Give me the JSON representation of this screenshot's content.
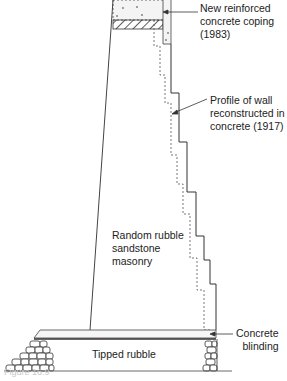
{
  "diagram": {
    "type": "wall cross-section",
    "labels": {
      "coping": [
        "New reinforced",
        "concrete coping",
        "(1983)"
      ],
      "profile": [
        "Profile of wall",
        "reconstructed in",
        "concrete (1917)"
      ],
      "masonry": [
        "Random rubble",
        "sandstone",
        "masonry"
      ],
      "blinding": [
        "Concrete",
        "blinding"
      ],
      "rubble": "Tipped rubble"
    },
    "caption": "Figure 16.9"
  }
}
